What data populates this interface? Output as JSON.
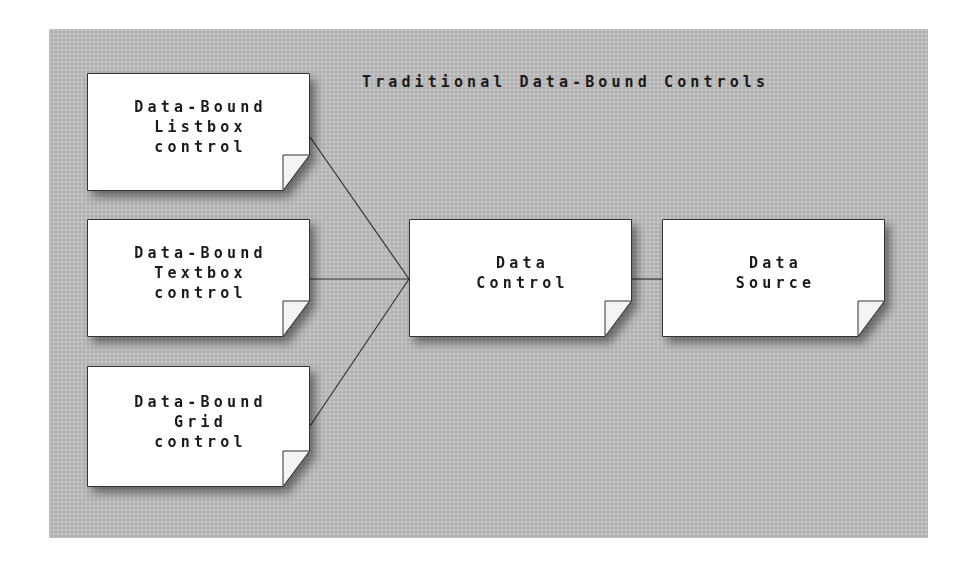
{
  "diagram": {
    "title": "Traditional Data-Bound Controls",
    "background_color": "#b9b9b9",
    "node_fill": "#ffffff",
    "line_color": "#333333",
    "nodes": [
      {
        "id": "listbox",
        "lines": [
          "Data-Bound",
          "Listbox",
          "control"
        ]
      },
      {
        "id": "textbox",
        "lines": [
          "Data-Bound",
          "Textbox",
          "control"
        ]
      },
      {
        "id": "grid",
        "lines": [
          "Data-Bound",
          "Grid",
          "control"
        ]
      },
      {
        "id": "data_control",
        "lines": [
          "Data",
          "Control"
        ]
      },
      {
        "id": "data_source",
        "lines": [
          "Data",
          "Source"
        ]
      }
    ],
    "edges": [
      {
        "from": "listbox",
        "to": "data_control"
      },
      {
        "from": "textbox",
        "to": "data_control"
      },
      {
        "from": "grid",
        "to": "data_control"
      },
      {
        "from": "data_control",
        "to": "data_source"
      }
    ]
  }
}
